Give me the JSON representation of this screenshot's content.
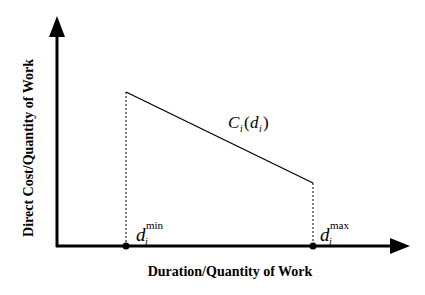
{
  "diagram": {
    "y_axis_label": "Direct Cost/Quantity of Work",
    "x_axis_label": "Duration/Quantity of Work",
    "curve_label": {
      "base": "C",
      "sub": "i",
      "open": "(",
      "arg_base": "d",
      "arg_sub": "i",
      "close": ")"
    },
    "points": [
      {
        "base": "d",
        "sub": "i",
        "sup": "min"
      },
      {
        "base": "d",
        "sub": "i",
        "sup": "max"
      }
    ],
    "line": {
      "x1": 126,
      "y1": 92,
      "x2": 313,
      "y2": 183
    },
    "colors": {
      "ink": "#000000",
      "background": "#ffffff"
    }
  }
}
